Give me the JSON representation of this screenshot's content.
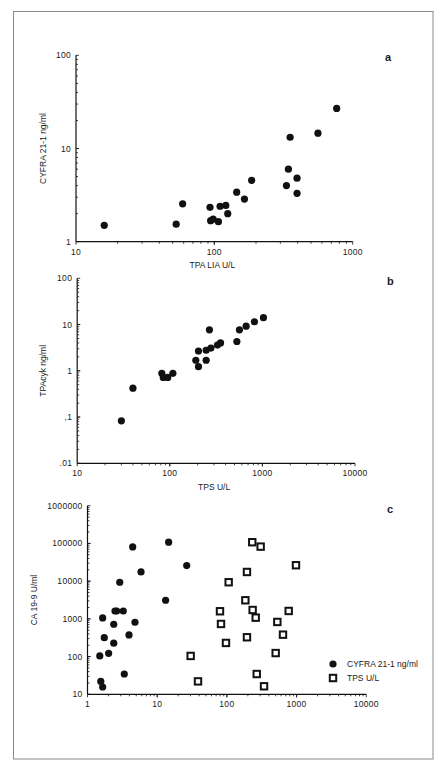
{
  "figure": {
    "frame_color": "#8a8a8a",
    "ink_color": "#111111"
  },
  "chart_data": [
    {
      "id": "a",
      "panel_label": "a",
      "type": "scatter",
      "title": "",
      "xlabel": "TPA LIA U/L",
      "ylabel": "CYFRA 21-1 ng/ml",
      "xscale": "log",
      "yscale": "log",
      "xlim": [
        10,
        1000
      ],
      "ylim": [
        1,
        100
      ],
      "x_ticks": [
        {
          "v": 10,
          "label": "10"
        },
        {
          "v": 100,
          "label": "100"
        },
        {
          "v": 1000,
          "label": "1000"
        }
      ],
      "y_ticks": [
        {
          "v": 1,
          "label": "1"
        },
        {
          "v": 10,
          "label": "10"
        },
        {
          "v": 100,
          "label": "100"
        }
      ],
      "grid": false,
      "legend": null,
      "layout": {
        "x0": 76,
        "x1": 352.7,
        "y_bottom": 241.7,
        "y_top": 55.3,
        "label_x": 385,
        "label_y": 61,
        "xlabel_y": 268,
        "ylabel_x": 46
      },
      "series": [
        {
          "name": "CYFRA 21-1 vs TPA LIA",
          "marker": "filled-circle",
          "points": [
            [
              16,
              1.5
            ],
            [
              53,
              1.54
            ],
            [
              59,
              2.55
            ],
            [
              93,
              2.34
            ],
            [
              94,
              1.68
            ],
            [
              98,
              1.75
            ],
            [
              107,
              1.64
            ],
            [
              110,
              2.4
            ],
            [
              121,
              2.45
            ],
            [
              125,
              2.0
            ],
            [
              145,
              3.4
            ],
            [
              165,
              2.87
            ],
            [
              186,
              4.55
            ],
            [
              332,
              4.0
            ],
            [
              343,
              6.0
            ],
            [
              353,
              13.2
            ],
            [
              396,
              4.8
            ],
            [
              396,
              3.3
            ],
            [
              561,
              14.6
            ],
            [
              766,
              26.9
            ]
          ]
        }
      ]
    },
    {
      "id": "b",
      "panel_label": "b",
      "type": "scatter",
      "title": "",
      "xlabel": "TPS U/L",
      "ylabel": "TPAcyk ng/ml",
      "xscale": "log",
      "yscale": "log",
      "xlim": [
        10,
        10000
      ],
      "ylim": [
        0.01,
        100
      ],
      "x_ticks": [
        {
          "v": 10,
          "label": "10"
        },
        {
          "v": 100,
          "label": "100"
        },
        {
          "v": 1000,
          "label": "1000"
        },
        {
          "v": 10000,
          "label": "10000"
        }
      ],
      "y_ticks": [
        {
          "v": 0.01,
          "label": ".01"
        },
        {
          "v": 0.1,
          "label": ",1"
        },
        {
          "v": 1,
          "label": "1"
        },
        {
          "v": 10,
          "label": "10"
        },
        {
          "v": 100,
          "label": "100"
        }
      ],
      "grid": false,
      "legend": null,
      "layout": {
        "x0": 77.2,
        "x1": 355,
        "y_bottom": 463.3,
        "y_top": 278.3,
        "label_x": 387,
        "label_y": 285,
        "xlabel_y": 490,
        "ylabel_x": 46
      },
      "series": [
        {
          "name": "TPAcyk vs TPS",
          "marker": "filled-circle",
          "points": [
            [
              30,
              0.083
            ],
            [
              40,
              0.42
            ],
            [
              82,
              0.88
            ],
            [
              85,
              0.72
            ],
            [
              95,
              0.72
            ],
            [
              108,
              0.88
            ],
            [
              191,
              1.69
            ],
            [
              204,
              1.23
            ],
            [
              204,
              2.68
            ],
            [
              247,
              1.69
            ],
            [
              247,
              2.78
            ],
            [
              268,
              7.7
            ],
            [
              278,
              3.1
            ],
            [
              327,
              3.6
            ],
            [
              353,
              4.0
            ],
            [
              530,
              4.3
            ],
            [
              565,
              7.7
            ],
            [
              667,
              9.2
            ],
            [
              820,
              11.5
            ],
            [
              1026,
              14.1
            ]
          ]
        }
      ]
    },
    {
      "id": "c",
      "panel_label": "c",
      "type": "scatter",
      "title": "",
      "xlabel": "",
      "ylabel": "CA 19-9 U/ml",
      "xscale": "log",
      "yscale": "log",
      "xlim": [
        1,
        10000
      ],
      "ylim": [
        10,
        1000000
      ],
      "x_ticks": [
        {
          "v": 1,
          "label": "1"
        },
        {
          "v": 10,
          "label": "10"
        },
        {
          "v": 100,
          "label": "100"
        },
        {
          "v": 1000,
          "label": "1000"
        },
        {
          "v": 10000,
          "label": "10000"
        }
      ],
      "y_ticks": [
        {
          "v": 10,
          "label": "10"
        },
        {
          "v": 100,
          "label": "100"
        },
        {
          "v": 1000,
          "label": "1000"
        },
        {
          "v": 10000,
          "label": "10000"
        },
        {
          "v": 100000,
          "label": "100000"
        },
        {
          "v": 1000000,
          "label": "1000000"
        }
      ],
      "grid": false,
      "legend": {
        "position": "lower-right",
        "entries": [
          {
            "marker": "filled-circle",
            "label": "CYFRA 21-1 ng/ml"
          },
          {
            "marker": "open-square",
            "label": "TPS U/L"
          }
        ]
      },
      "layout": {
        "x0": 87.5,
        "x1": 366.3,
        "y_bottom": 694.3,
        "y_top": 505.7,
        "label_x": 387,
        "label_y": 513,
        "xlabel_y": 0,
        "ylabel_x": 37,
        "legend_x": 333,
        "legend_y": 664
      },
      "series": [
        {
          "name": "CYFRA 21-1 ng/ml",
          "marker": "filled-circle",
          "points": [
            [
              1.5,
              104
            ],
            [
              1.55,
              22
            ],
            [
              1.65,
              15.6
            ],
            [
              1.65,
              1057
            ],
            [
              1.74,
              317
            ],
            [
              2.01,
              122
            ],
            [
              2.38,
              719
            ],
            [
              2.38,
              226
            ],
            [
              2.48,
              1618
            ],
            [
              2.62,
              1618
            ],
            [
              2.9,
              9350
            ],
            [
              3.26,
              1618
            ],
            [
              3.37,
              34.5
            ],
            [
              3.94,
              374
            ],
            [
              4.45,
              80700
            ],
            [
              4.8,
              813
            ],
            [
              5.86,
              17500
            ],
            [
              13.2,
              3110
            ],
            [
              14.6,
              107700
            ],
            [
              26.5,
              25800
            ]
          ]
        },
        {
          "name": "TPS U/L",
          "marker": "open-square",
          "points": [
            [
              30.2,
              104
            ],
            [
              38.5,
              22
            ],
            [
              79.6,
              1590
            ],
            [
              82.3,
              733
            ],
            [
              97,
              230
            ],
            [
              106,
              9350
            ],
            [
              184,
              3110
            ],
            [
              194,
              17500
            ],
            [
              194,
              325
            ],
            [
              231,
              107700
            ],
            [
              234,
              1720
            ],
            [
              259,
              1076
            ],
            [
              268,
              34.5
            ],
            [
              305,
              82200
            ],
            [
              341,
              16.3
            ],
            [
              501,
              124
            ],
            [
              529,
              828
            ],
            [
              638,
              381
            ],
            [
              770,
              1620
            ],
            [
              980,
              26400
            ]
          ]
        }
      ]
    }
  ]
}
